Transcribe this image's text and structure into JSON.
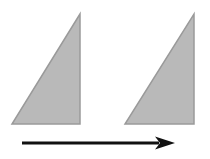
{
  "diagram": {
    "colors": {
      "background": "#ffffff",
      "shape_fill": "#b9b9b9",
      "shape_stroke": "#9a9a9a",
      "arrow": "#111111"
    },
    "shapes": [
      {
        "id": "original-triangle",
        "type": "right-triangle",
        "points": [
          [
            12,
            124
          ],
          [
            80,
            124
          ],
          [
            80,
            14
          ]
        ]
      },
      {
        "id": "translated-triangle",
        "type": "right-triangle",
        "points": [
          [
            125,
            124
          ],
          [
            194,
            124
          ],
          [
            194,
            14
          ]
        ]
      }
    ],
    "arrow": {
      "direction": "right",
      "x1": 22,
      "y1": 143,
      "x2": 175,
      "y2": 143,
      "stroke_width": 3,
      "head_length": 20,
      "head_half_width": 6.5
    }
  }
}
